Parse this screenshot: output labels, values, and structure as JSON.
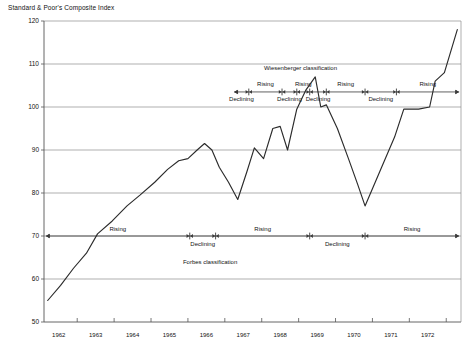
{
  "chart_title": "Standard & Poor's Composite Index",
  "chart_data": {
    "type": "line",
    "title": "Standard & Poor's Composite Index",
    "xlabel": "",
    "ylabel": "Standard & Poor's Composite Index",
    "xlim": [
      1961.6,
      1972.9
    ],
    "ylim": [
      50,
      120
    ],
    "yticks": [
      50,
      60,
      70,
      80,
      90,
      100,
      110,
      120
    ],
    "ytick_labels": [
      "50",
      "60",
      "70",
      "80",
      "90",
      "100",
      "110",
      "120"
    ],
    "xticks": [
      1962,
      1963,
      1964,
      1965,
      1966,
      1967,
      1968,
      1969,
      1970,
      1971,
      1972
    ],
    "xtick_labels": [
      "1962",
      "1963",
      "1964",
      "1965",
      "1966",
      "1967",
      "1968",
      "1969",
      "1970",
      "1971",
      "1972"
    ],
    "grid": "horizontal",
    "legend": "none",
    "series": [
      {
        "name": "S&P Composite Index",
        "color": "#2b2b2b",
        "points": [
          [
            1961.7,
            55.0
          ],
          [
            1962.05,
            58.5
          ],
          [
            1962.4,
            62.5
          ],
          [
            1962.75,
            66.0
          ],
          [
            1963.05,
            70.5
          ],
          [
            1963.45,
            73.5
          ],
          [
            1963.85,
            77.0
          ],
          [
            1964.2,
            79.5
          ],
          [
            1964.6,
            82.5
          ],
          [
            1964.95,
            85.5
          ],
          [
            1965.25,
            87.5
          ],
          [
            1965.5,
            88.0
          ],
          [
            1965.75,
            90.0
          ],
          [
            1965.95,
            91.5
          ],
          [
            1966.15,
            90.0
          ],
          [
            1966.35,
            86.0
          ],
          [
            1966.6,
            82.5
          ],
          [
            1966.85,
            78.5
          ],
          [
            1967.1,
            85.0
          ],
          [
            1967.3,
            90.5
          ],
          [
            1967.55,
            88.0
          ],
          [
            1967.8,
            95.0
          ],
          [
            1968.0,
            95.5
          ],
          [
            1968.2,
            90.0
          ],
          [
            1968.45,
            99.5
          ],
          [
            1968.7,
            104.0
          ],
          [
            1968.95,
            107.0
          ],
          [
            1969.1,
            100.0
          ],
          [
            1969.25,
            100.5
          ],
          [
            1969.55,
            95.0
          ],
          [
            1969.85,
            88.0
          ],
          [
            1970.1,
            82.0
          ],
          [
            1970.3,
            77.0
          ],
          [
            1970.7,
            85.0
          ],
          [
            1971.1,
            93.0
          ],
          [
            1971.35,
            99.5
          ],
          [
            1971.75,
            99.5
          ],
          [
            1972.05,
            100.0
          ],
          [
            1972.2,
            106.0
          ],
          [
            1972.45,
            108.0
          ],
          [
            1972.8,
            118.0
          ]
        ]
      }
    ],
    "annotation_bands": [
      {
        "name": "Wiesenberger classification",
        "label": "Wiesenberger classification",
        "label_x": 1968.55,
        "axis_value": 103.5,
        "label_value": 108.5,
        "segments": [
          {
            "label": "Declining",
            "from": 1966.75,
            "to": 1967.15,
            "side": "below"
          },
          {
            "label": "Rising",
            "from": 1967.15,
            "to": 1968.05,
            "side": "above"
          },
          {
            "label": "Declining",
            "from": 1968.05,
            "to": 1968.45,
            "side": "below"
          },
          {
            "label": "Rising",
            "from": 1968.45,
            "to": 1968.8,
            "side": "above"
          },
          {
            "label": "Declining",
            "from": 1968.8,
            "to": 1969.25,
            "side": "below"
          },
          {
            "label": "Rising",
            "from": 1969.25,
            "to": 1970.3,
            "side": "above"
          },
          {
            "label": "Declining",
            "from": 1970.3,
            "to": 1971.15,
            "side": "below"
          },
          {
            "label": "Rising",
            "from": 1971.15,
            "to": 1972.85,
            "side": "above"
          }
        ]
      },
      {
        "name": "Forbes classification",
        "label": "Forbes classification",
        "label_x": 1966.1,
        "axis_value": 70.0,
        "label_value": 63.5,
        "segments": [
          {
            "label": "Rising",
            "from": 1961.65,
            "to": 1965.55,
            "side": "above"
          },
          {
            "label": "Declining",
            "from": 1965.55,
            "to": 1966.25,
            "side": "below"
          },
          {
            "label": "Rising",
            "from": 1966.25,
            "to": 1968.8,
            "side": "above"
          },
          {
            "label": "Declining",
            "from": 1968.8,
            "to": 1970.3,
            "side": "below"
          },
          {
            "label": "Rising",
            "from": 1970.3,
            "to": 1972.85,
            "side": "above"
          }
        ]
      }
    ]
  }
}
